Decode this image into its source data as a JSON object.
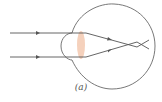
{
  "diagram": {
    "caption": "(a)",
    "colors": {
      "stroke": "#555555",
      "lens": "#f3c9b0",
      "background": "#ffffff"
    },
    "elements": {
      "eyeball": "circle",
      "cornea": "bulge",
      "lens": "ellipse",
      "rays": [
        "upper-ray",
        "lower-ray"
      ],
      "arrows": 4
    }
  }
}
